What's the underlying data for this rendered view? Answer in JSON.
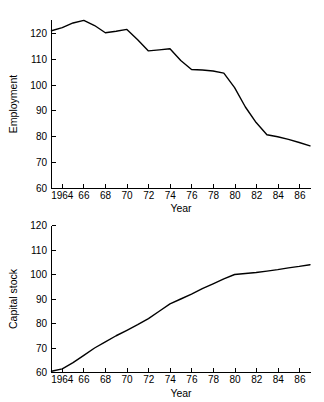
{
  "figure": {
    "background_color": "#ffffff",
    "line_color": "#000000",
    "axis_color": "#000000"
  },
  "chart_data": [
    {
      "type": "line",
      "title": "",
      "xlabel": "Year",
      "ylabel": "Employment",
      "xlim": [
        1963,
        1987
      ],
      "ylim": [
        60,
        126
      ],
      "grid": false,
      "legend": "none",
      "xticks": [
        1964,
        66,
        68,
        70,
        72,
        74,
        76,
        78,
        80,
        82,
        84,
        86
      ],
      "xtick_labels": [
        "1964",
        "66",
        "68",
        "70",
        "72",
        "74",
        "76",
        "78",
        "80",
        "82",
        "84",
        "86"
      ],
      "yticks": [
        60,
        70,
        80,
        90,
        100,
        110,
        120
      ],
      "ytick_labels": [
        "60",
        "70",
        "80",
        "90",
        "100",
        "110",
        "120"
      ],
      "x": [
        1963,
        1964,
        1965,
        1966,
        1967,
        1968,
        1969,
        1970,
        1971,
        1972,
        1973,
        1974,
        1975,
        1976,
        1977,
        1978,
        1979,
        1980,
        1981,
        1982,
        1983,
        1984,
        1985,
        1986,
        1987
      ],
      "values": [
        121.0,
        122.2,
        124.0,
        125.0,
        123.0,
        120.2,
        120.8,
        121.5,
        117.5,
        113.2,
        113.6,
        114.0,
        109.5,
        106.0,
        105.8,
        105.4,
        104.6,
        99.0,
        91.5,
        85.5,
        80.8,
        80.0,
        79.0,
        77.8,
        76.5
      ]
    },
    {
      "type": "line",
      "title": "",
      "xlabel": "Year",
      "ylabel": "Capital stock",
      "xlim": [
        1963,
        1987
      ],
      "ylim": [
        60,
        120
      ],
      "grid": false,
      "legend": "none",
      "xticks": [
        1964,
        66,
        68,
        70,
        72,
        74,
        76,
        78,
        80,
        82,
        84,
        86
      ],
      "xtick_labels": [
        "1964",
        "66",
        "68",
        "70",
        "72",
        "74",
        "76",
        "78",
        "80",
        "82",
        "84",
        "86"
      ],
      "yticks": [
        60,
        70,
        80,
        90,
        100,
        110,
        120
      ],
      "ytick_labels": [
        "60",
        "70",
        "80",
        "90",
        "100",
        "110",
        "120"
      ],
      "x": [
        1963,
        1964,
        1965,
        1966,
        1967,
        1968,
        1969,
        1970,
        1971,
        1972,
        1973,
        1974,
        1975,
        1976,
        1977,
        1978,
        1979,
        1980,
        1981,
        1982,
        1983,
        1984,
        1985,
        1986,
        1987
      ],
      "values": [
        60.5,
        61.5,
        64.0,
        67.0,
        70.0,
        72.5,
        75.0,
        77.2,
        79.5,
        82.0,
        85.0,
        88.0,
        90.0,
        92.0,
        94.2,
        96.2,
        98.2,
        100.0,
        100.4,
        100.8,
        101.4,
        102.0,
        102.7,
        103.3,
        104.0
      ]
    }
  ]
}
